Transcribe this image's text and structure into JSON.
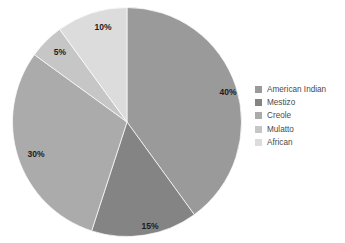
{
  "chart_data": {
    "type": "pie",
    "title": "",
    "subtitle": "",
    "xlabel": "",
    "ylabel": "",
    "grid": false,
    "legend_position": "right",
    "start_angle_deg": 0,
    "direction": "clockwise",
    "categories": [
      "American Indian",
      "Mestizo",
      "Creole",
      "Mulatto",
      "African"
    ],
    "values": [
      40,
      15,
      30,
      5,
      10
    ],
    "value_unit": "%",
    "data_labels": [
      "40%",
      "15%",
      "30%",
      "5%",
      "10%"
    ],
    "colors": [
      "#9a9a9a",
      "#848484",
      "#ababab",
      "#c6c6c6",
      "#dcdcdc"
    ],
    "slices": [
      {
        "label": "American Indian",
        "value": 40,
        "data_label": "40%",
        "color": "#9a9a9a"
      },
      {
        "label": "Mestizo",
        "value": 15,
        "data_label": "15%",
        "color": "#848484"
      },
      {
        "label": "Creole",
        "value": 30,
        "data_label": "30%",
        "color": "#ababab"
      },
      {
        "label": "Mulatto",
        "value": 5,
        "data_label": "5%",
        "color": "#c6c6c6"
      },
      {
        "label": "African",
        "value": 10,
        "data_label": "10%",
        "color": "#dcdcdc"
      }
    ]
  },
  "legend": {
    "items": [
      {
        "label": "American Indian",
        "color": "#9a9a9a"
      },
      {
        "label": "Mestizo",
        "color": "#848484"
      },
      {
        "label": "Creole",
        "color": "#ababab"
      },
      {
        "label": "Mulatto",
        "color": "#c6c6c6"
      },
      {
        "label": "African",
        "color": "#dcdcdc"
      }
    ]
  },
  "labels": {
    "slice_0": "40%",
    "slice_1": "15%",
    "slice_2": "30%",
    "slice_3": "5%",
    "slice_4": "10%"
  }
}
